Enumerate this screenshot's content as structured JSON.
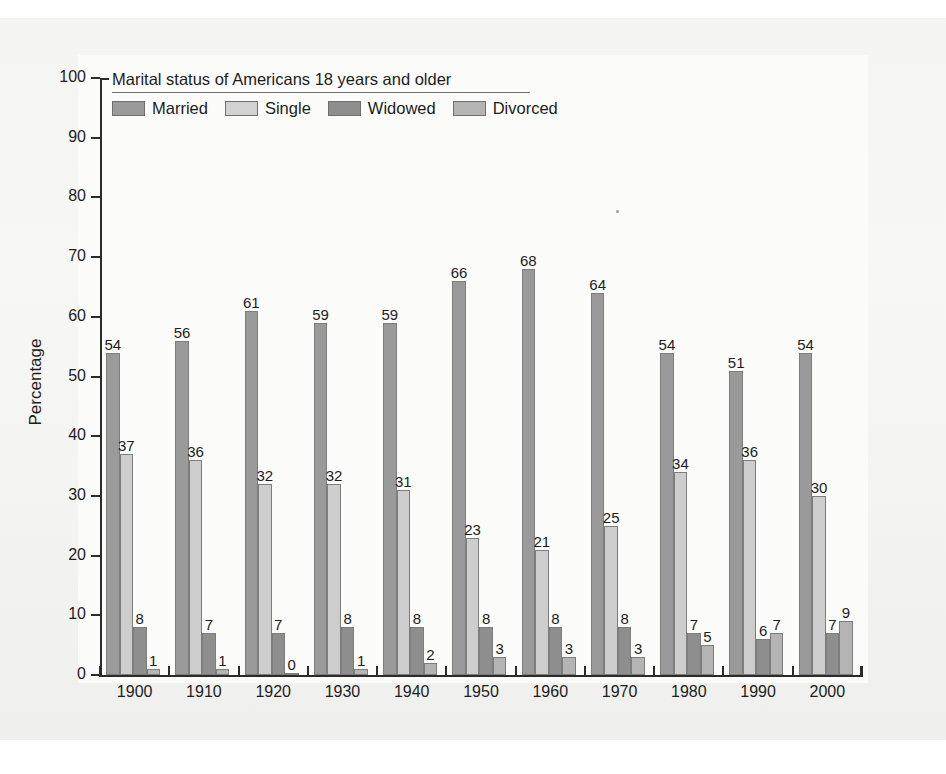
{
  "figure": {
    "background_color": "#fbfbfa",
    "axis_color": "#2b2b2b",
    "text_color": "#1d1d1d"
  },
  "legend": {
    "title": "Marital status of Americans 18 years and older",
    "position": "top-left-inside",
    "entries": [
      {
        "label": "Married",
        "color": "#9a9a9a"
      },
      {
        "label": "Single",
        "color": "#d2d2d2"
      },
      {
        "label": "Widowed",
        "color": "#8e8e8e"
      },
      {
        "label": "Divorced",
        "color": "#b4b4b4"
      }
    ]
  },
  "axes": {
    "y_title": "Percentage",
    "y_ticks": [
      "0",
      "10",
      "20",
      "30",
      "40",
      "50",
      "60",
      "70",
      "80",
      "90",
      "100"
    ],
    "x_ticks": [
      "1900",
      "1910",
      "1920",
      "1930",
      "1940",
      "1950",
      "1960",
      "1970",
      "1980",
      "1990",
      "2000"
    ]
  },
  "chart_data": {
    "type": "bar",
    "title": "Marital status of Americans 18 years and older",
    "xlabel": "",
    "ylabel": "Percentage",
    "ylim": [
      0,
      100
    ],
    "ytick_step": 10,
    "grid": false,
    "legend_position": "upper left (inside plot)",
    "categories": [
      "1900",
      "1910",
      "1920",
      "1930",
      "1940",
      "1950",
      "1960",
      "1970",
      "1980",
      "1990",
      "2000"
    ],
    "series": [
      {
        "name": "Married",
        "color": "#9a9a9a",
        "values": [
          54,
          56,
          61,
          59,
          59,
          66,
          68,
          64,
          54,
          51,
          54
        ]
      },
      {
        "name": "Single",
        "color": "#d2d2d2",
        "values": [
          37,
          36,
          32,
          32,
          31,
          23,
          21,
          25,
          34,
          36,
          30
        ]
      },
      {
        "name": "Widowed",
        "color": "#8e8e8e",
        "values": [
          8,
          7,
          7,
          8,
          8,
          8,
          8,
          8,
          7,
          6,
          7
        ]
      },
      {
        "name": "Divorced",
        "color": "#b4b4b4",
        "values": [
          1,
          1,
          0,
          1,
          2,
          3,
          3,
          3,
          5,
          7,
          9
        ]
      }
    ],
    "data_labels": true,
    "data_label_position": "above-bar"
  }
}
